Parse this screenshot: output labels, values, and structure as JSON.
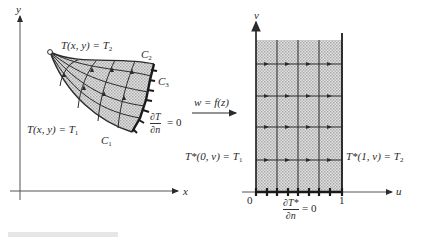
{
  "left_panel": {
    "axis_x_label": "x",
    "axis_y_label": "y",
    "boundary_top_label": "T(x, y) = T",
    "boundary_top_sub": "2",
    "boundary_bottom_label": "T(x, y) = T",
    "boundary_bottom_sub": "1",
    "curve_labels": {
      "c1": "C",
      "c1_sub": "1",
      "c2": "C",
      "c2_sub": "2",
      "c3": "C",
      "c3_sub": "3"
    },
    "neumann_num": "∂T",
    "neumann_den": "∂n",
    "neumann_rhs": "= 0"
  },
  "mapping": {
    "label": "w = f(z)"
  },
  "right_panel": {
    "axis_u_label": "u",
    "axis_v_label": "v",
    "origin_label": "0",
    "one_label": "1",
    "left_bc_label": "T*(0, v) = T",
    "left_bc_sub": "1",
    "right_bc_label": "T*(1, v) = T",
    "right_bc_sub": "2",
    "neumann_num": "∂T*",
    "neumann_den": "∂n",
    "neumann_rhs": "= 0"
  },
  "colors": {
    "line": "#2b2b2b",
    "fill": "#c9c9c9"
  }
}
